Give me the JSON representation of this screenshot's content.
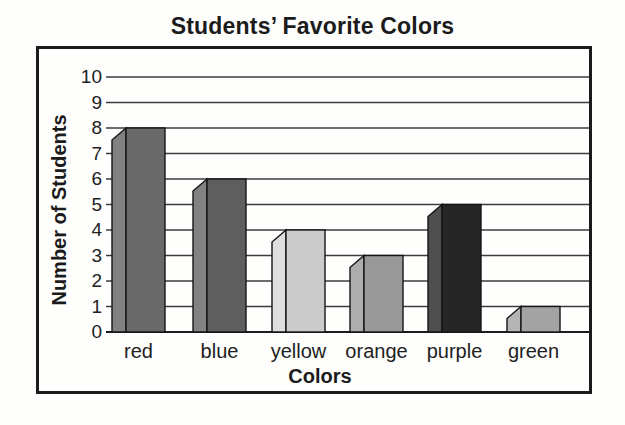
{
  "page": {
    "background": "#fdfdfc",
    "frame_border_color": "#1b1b1b"
  },
  "chart_data": {
    "type": "bar",
    "title": "Students’ Favorite Colors",
    "xlabel": "Colors",
    "ylabel": "Number of Students",
    "categories": [
      "red",
      "blue",
      "yellow",
      "orange",
      "purple",
      "green"
    ],
    "values": [
      8,
      6,
      4,
      3,
      5,
      1
    ],
    "ylim": [
      0,
      10
    ],
    "yticks": [
      0,
      1,
      2,
      3,
      4,
      5,
      6,
      7,
      8,
      9,
      10
    ],
    "grid": true,
    "legend": false,
    "bar_style": "3d-bevel-left",
    "grid_color": "#3c3c3c",
    "baseline_color": "#1b1b1b",
    "bar_outline_color": "#161616",
    "bar_colors": [
      {
        "category": "red",
        "face": "#696969",
        "side": "#818181"
      },
      {
        "category": "blue",
        "face": "#5e5e5e",
        "side": "#828282"
      },
      {
        "category": "yellow",
        "face": "#cbcbcb",
        "side": "#dedede"
      },
      {
        "category": "orange",
        "face": "#999999",
        "side": "#adadad"
      },
      {
        "category": "purple",
        "face": "#262626",
        "side": "#4f4f4f"
      },
      {
        "category": "green",
        "face": "#a3a3a3",
        "side": "#b5b5b5"
      }
    ]
  }
}
